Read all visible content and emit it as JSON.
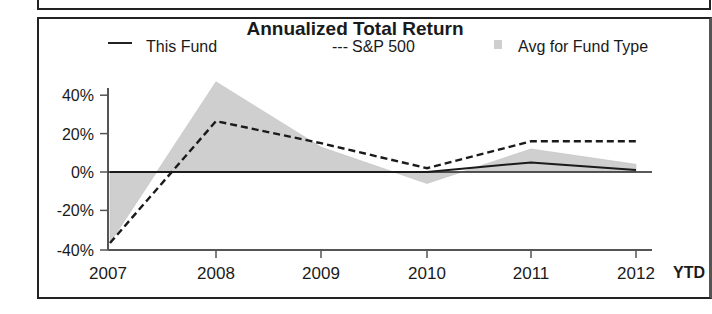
{
  "chart_data": {
    "type": "line",
    "title": "Annualized Total Return",
    "categories": [
      "2007",
      "2008",
      "2009",
      "2010",
      "2011",
      "2012"
    ],
    "x_suffix_label": "YTD",
    "yticks": [
      "40%",
      "20%",
      "0%",
      "-20%",
      "-40%"
    ],
    "ylim": [
      -40,
      50
    ],
    "series": [
      {
        "name": "This Fund",
        "style": "solid",
        "values": [
          0,
          0,
          0,
          0,
          5,
          1
        ]
      },
      {
        "name": "S&P 500",
        "style": "dashed",
        "values": [
          -37,
          26.5,
          15,
          2,
          16,
          16
        ]
      },
      {
        "name": "Avg for Fund Type",
        "style": "area",
        "values": [
          -37,
          47,
          13,
          -6,
          12,
          4
        ]
      }
    ],
    "legend_position": "top",
    "grid": false
  },
  "legend": {
    "this_fund": "This Fund",
    "sp500_prefix": "---",
    "sp500": "S&P 500",
    "avg": "Avg for Fund Type"
  },
  "colors": {
    "line": "#1a1a1a",
    "area": "#cfcfcf",
    "axis": "#555555"
  }
}
